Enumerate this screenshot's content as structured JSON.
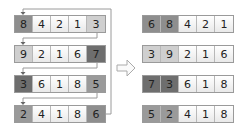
{
  "left": {
    "rows": [
      {
        "cells": [
          "8",
          "4",
          "2",
          "1",
          "3"
        ],
        "shades": [
          "#8e8e8e",
          "#f5f5f5",
          "#f5f5f5",
          "#f5f5f5",
          "#cfcfcf"
        ]
      },
      {
        "cells": [
          "9",
          "2",
          "1",
          "6",
          "7"
        ],
        "shades": [
          "#cfcfcf",
          "#f5f5f5",
          "#f5f5f5",
          "#f5f5f5",
          "#6e6e6e"
        ]
      },
      {
        "cells": [
          "3",
          "6",
          "1",
          "8",
          "5"
        ],
        "shades": [
          "#6e6e6e",
          "#f5f5f5",
          "#f5f5f5",
          "#f5f5f5",
          "#9a9a9a"
        ]
      },
      {
        "cells": [
          "2",
          "4",
          "1",
          "8",
          "6"
        ],
        "shades": [
          "#9a9a9a",
          "#f5f5f5",
          "#f5f5f5",
          "#f5f5f5",
          "#8e8e8e"
        ]
      }
    ]
  },
  "right": {
    "rows": [
      {
        "cells": [
          "6",
          "8",
          "4",
          "2",
          "1"
        ],
        "shades": [
          "#8e8e8e",
          "#8e8e8e",
          "#f5f5f5",
          "#f5f5f5",
          "#f5f5f5"
        ]
      },
      {
        "cells": [
          "3",
          "9",
          "2",
          "1",
          "6"
        ],
        "shades": [
          "#cfcfcf",
          "#cfcfcf",
          "#f5f5f5",
          "#f5f5f5",
          "#f5f5f5"
        ]
      },
      {
        "cells": [
          "7",
          "3",
          "6",
          "1",
          "8"
        ],
        "shades": [
          "#6e6e6e",
          "#6e6e6e",
          "#f5f5f5",
          "#f5f5f5",
          "#f5f5f5"
        ]
      },
      {
        "cells": [
          "5",
          "2",
          "4",
          "1",
          "8"
        ],
        "shades": [
          "#9a9a9a",
          "#9a9a9a",
          "#f5f5f5",
          "#f5f5f5",
          "#f5f5f5"
        ]
      }
    ]
  },
  "arrow_icon": "right-arrow-outline",
  "colors": {
    "line": "#9a9a9a",
    "arrow": "#aaaaaa"
  }
}
